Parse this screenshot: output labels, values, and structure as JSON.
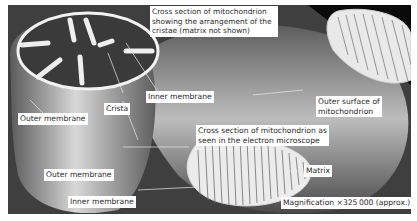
{
  "diagram": {
    "labels": {
      "cross_section_cristae": [
        "Cross section of mitochondrion",
        "showing the arrangement of the",
        "cristae (matrix not shown)"
      ],
      "inner_membrane_top": "Inner membrane",
      "crista": "Crista",
      "outer_membrane_left": "Outer membrane",
      "outer_surface": [
        "Outer surface of",
        "mitochondrion"
      ],
      "cross_section_em": [
        "Cross section of mitochondrion as",
        "seen in the electron microscope"
      ],
      "outer_membrane_bottom": "Outer membrane",
      "matrix": "Matrix",
      "inner_membrane_bottom": "Inner membrane",
      "magnification": "Magnification ×325 000 (approx.)"
    },
    "colors": {
      "background": "#ffffff",
      "label_bg": "#ffffff",
      "label_text": "#2b2b2b",
      "line": "#e8e8e8"
    }
  }
}
